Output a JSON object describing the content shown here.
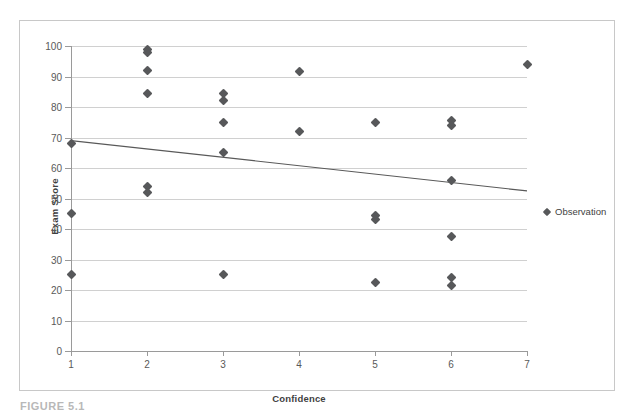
{
  "figure": {
    "caption": "FIGURE 5.1"
  },
  "legend": {
    "position": "right",
    "entries": [
      {
        "label": "Observation",
        "marker": "diamond-marker-icon",
        "color": "#57585a"
      }
    ]
  },
  "chart_data": {
    "type": "scatter",
    "title": "",
    "xlabel": "Confidence",
    "ylabel": "Exam Score",
    "xlim": [
      1,
      7
    ],
    "ylim": [
      0,
      100
    ],
    "xticks": [
      1,
      2,
      3,
      4,
      5,
      6,
      7
    ],
    "yticks": [
      0,
      10,
      20,
      30,
      40,
      50,
      60,
      70,
      80,
      90,
      100
    ],
    "grid": true,
    "marker_color": "#57585a",
    "trendline_color": "#595959",
    "series": [
      {
        "name": "Observation",
        "points": [
          [
            1,
            68
          ],
          [
            1,
            45
          ],
          [
            1,
            25
          ],
          [
            2,
            99
          ],
          [
            2,
            98
          ],
          [
            2,
            92
          ],
          [
            2,
            84.5
          ],
          [
            2,
            54
          ],
          [
            2,
            52
          ],
          [
            3,
            84.5
          ],
          [
            3,
            82
          ],
          [
            3,
            75
          ],
          [
            3,
            65
          ],
          [
            3,
            25
          ],
          [
            4,
            91.5
          ],
          [
            4,
            72
          ],
          [
            5,
            75
          ],
          [
            5,
            44.5
          ],
          [
            5,
            43
          ],
          [
            5,
            22.5
          ],
          [
            6,
            75.5
          ],
          [
            6,
            74
          ],
          [
            6,
            56
          ],
          [
            6,
            37.5
          ],
          [
            6,
            24
          ],
          [
            6,
            21.5
          ],
          [
            7,
            94
          ]
        ]
      }
    ],
    "trendline": {
      "type": "linear",
      "x_start": 1,
      "y_start": 69,
      "x_end": 7,
      "y_end": 52.5
    }
  }
}
